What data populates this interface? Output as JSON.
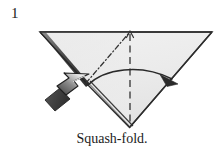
{
  "figure": {
    "type": "origami-diagram",
    "step_number": "1",
    "caption": "Squash-fold.",
    "background_color": "#ffffff",
    "paper_fill_color": "#ececec",
    "paper_fill_color_shaded": "#e2e2e2",
    "outline_color": "#2b2b2b",
    "fold_line_color": "#333333",
    "arrow_color": "#2a2a2a",
    "push_arrow_dark": "#4a4a4a",
    "push_arrow_light": "#f2f2f2"
  },
  "shapes": {
    "paper": {
      "name": "inverted-triangle",
      "description": "Large inverted triangle of paper, apex pointing down",
      "points": "40,32 212,32 130,127"
    },
    "left_shadow_edge": {
      "name": "left-folded-edge",
      "description": "Thick shaded edge along the upper-left side",
      "points": "40,32 86,83"
    },
    "bottom_double_edge": {
      "name": "lower-left-double-edge",
      "description": "Doubled layer line along the lower-left side of the triangle",
      "points": "86,83 130,127"
    }
  },
  "fold_lines": [
    {
      "name": "mountain-fold-diagonal",
      "style": "dash-dot",
      "from": "86,83",
      "to": "130,32",
      "label": "mountain fold (dash-dot)"
    },
    {
      "name": "valley-fold-vertical",
      "style": "dashed",
      "from": "130,32",
      "to": "130,127",
      "label": "valley fold (dashed)"
    }
  ],
  "arrows": [
    {
      "name": "fold-over-arrow",
      "type": "curved-solid-arrow",
      "direction": "left-to-right",
      "description": "Curved arrow sweeping from the left flap across to the right edge",
      "tip": "176,84"
    },
    {
      "name": "push-here-arrow",
      "type": "hollow-gradient-arrow",
      "direction": "up-right",
      "description": "Shaded push arrow indicating where to press to squash the flap",
      "tip": "88,76"
    },
    {
      "name": "valley-fold-tick-arrow",
      "type": "small-line-arrowhead",
      "direction": "up",
      "description": "Small arrowhead at the top of the vertical fold line",
      "tip": "130,32"
    }
  ]
}
